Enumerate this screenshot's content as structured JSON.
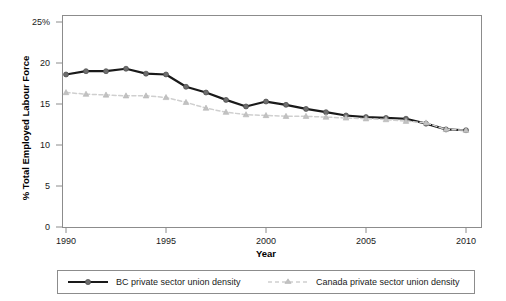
{
  "chart_data": {
    "type": "line",
    "title": "",
    "subtitle": "",
    "xlabel": "Year",
    "ylabel": "% Total Employed Labour Force",
    "xlim": [
      1989.4,
      2010.6
    ],
    "ylim": [
      0,
      25
    ],
    "xticks": [
      1990,
      1995,
      2000,
      2005,
      2010
    ],
    "xticklabels": [
      "1990",
      "1995",
      "2000",
      "2005",
      "2010"
    ],
    "yticks": [
      0,
      5,
      10,
      15,
      20,
      25
    ],
    "yticklabels": [
      "0",
      "5",
      "10",
      "15",
      "20",
      "25%"
    ],
    "grid": false,
    "legend_position": "bottom-outside",
    "x": [
      1990,
      1991,
      1992,
      1993,
      1994,
      1995,
      1996,
      1997,
      1998,
      1999,
      2000,
      2001,
      2002,
      2003,
      2004,
      2005,
      2006,
      2007,
      2008,
      2009,
      2010
    ],
    "series": [
      {
        "name": "BC private sector union density",
        "color": "#1a1a1a",
        "marker": "circle",
        "marker_color": "#6e6e6e",
        "linestyle": "solid",
        "values": [
          18.6,
          19.0,
          19.0,
          19.3,
          18.7,
          18.6,
          17.1,
          16.4,
          15.5,
          14.7,
          15.3,
          14.9,
          14.4,
          14.0,
          13.6,
          13.4,
          13.3,
          13.2,
          12.6,
          11.9,
          11.8
        ]
      },
      {
        "name": "Canada private sector union density",
        "color": "#d0d0d0",
        "marker": "triangle",
        "marker_color": "#c2c2c2",
        "linestyle": "dashed",
        "values": [
          16.4,
          16.2,
          16.1,
          16.0,
          16.0,
          15.8,
          15.2,
          14.5,
          14.0,
          13.7,
          13.6,
          13.5,
          13.5,
          13.4,
          13.3,
          13.2,
          13.1,
          12.9,
          12.7,
          11.9,
          11.8
        ]
      }
    ]
  },
  "axes": {
    "y_title": "% Total Employed Labour Force",
    "x_title": "Year",
    "y_tick_labels": [
      "25%",
      "20",
      "15",
      "10",
      "5",
      "0"
    ],
    "x_tick_labels": [
      "1990",
      "1995",
      "2000",
      "2005",
      "2010"
    ]
  },
  "legend": {
    "entries": [
      {
        "label": "BC private sector union density",
        "marker": "circle-solid-line-marker"
      },
      {
        "label": "Canada private sector union density",
        "marker": "triangle-dashed-line-marker"
      }
    ]
  },
  "colors": {
    "bc_line": "#1a1a1a",
    "bc_marker": "#6e6e6e",
    "canada_line": "#d4d4d4",
    "canada_marker": "#c2c2c2",
    "frame": "#8c8c8c",
    "background": "#ffffff"
  }
}
